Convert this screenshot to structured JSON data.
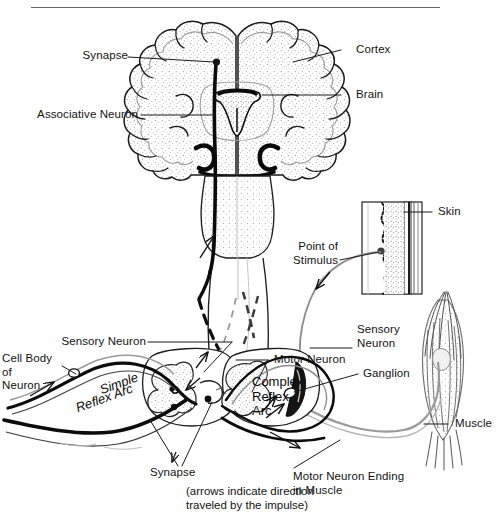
{
  "figure": {
    "top_rule": true,
    "caption": "(arrows indicate direction\ntraveled by the impulse)",
    "ink_color": "#101010",
    "gray_color": "#8a8a8a",
    "stipple_color": "#9a9a9a",
    "background": "#ffffff"
  },
  "labels": {
    "synapse_top": "Synapse",
    "associative_neuron": "Associative Neuron",
    "cortex": "Cortex",
    "brain": "Brain",
    "skin": "Skin",
    "point_of_stimulus": "Point of\nStimulus",
    "sensory_neuron_left": "Sensory Neuron",
    "sensory_neuron_right": "Sensory\nNeuron",
    "cell_body_of_neuron": "Cell Body\nof\nNeuron",
    "motor_neuron": "Motor Neuron",
    "ganglion": "Ganglion",
    "muscle": "Muscle",
    "motor_neuron_ending": "Motor Neuron Ending\nin Muscle",
    "synapse_bottom": "Synapse",
    "simple_reflex_arc_line1": "Simple",
    "simple_reflex_arc_line2": "Reflex Arc",
    "complex_reflex_arc": "Complex\nReflex\nArc"
  },
  "structures": {
    "brain": "coronal-section-cerebrum",
    "brainstem": "brainstem",
    "spinal_cord": "spinal-cord",
    "cord_cross_section_left": "gray-matter-butterfly",
    "cord_cross_section_right": "gray-matter-butterfly",
    "skin_block": "skin-cross-section",
    "muscle": "fusiform-muscle"
  }
}
